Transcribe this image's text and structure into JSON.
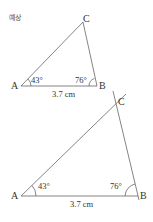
{
  "header": {
    "label": "예상"
  },
  "figures": [
    {
      "id": "triangle-small",
      "vertices": {
        "A": "A",
        "B": "B",
        "C": "C"
      },
      "angle_A": "43°",
      "angle_B": "76°",
      "side_AB": "3.7 cm"
    },
    {
      "id": "triangle-large",
      "vertices": {
        "A": "A",
        "B": "B",
        "C": "C"
      },
      "angle_A": "43°",
      "angle_B": "76°",
      "side_AB": "3.7 cm"
    }
  ],
  "colors": {
    "line": "#666666",
    "text": "#333333"
  }
}
